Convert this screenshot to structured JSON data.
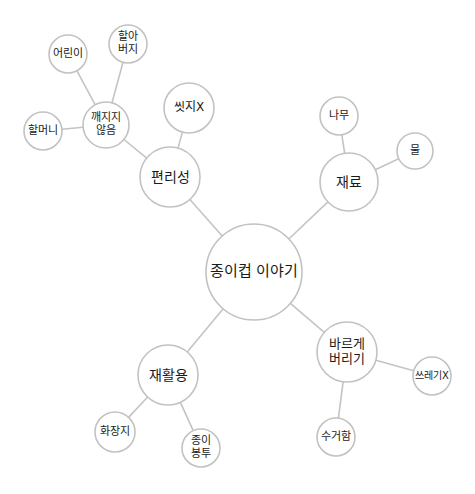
{
  "diagram": {
    "type": "mind-map",
    "style": {
      "background": "#ffffff",
      "edge_color": "#c4c4c4",
      "node_border": "#c2c2c2",
      "node_fill": "#ffffff",
      "text_color": "#1a1a1a"
    },
    "central": {
      "id": "paper-cup-story",
      "label": "종이컵 이야기",
      "cx": 254,
      "cy": 272,
      "r": 48,
      "font": 15
    },
    "nodes": [
      {
        "id": "convenience",
        "label": "편리성",
        "cx": 170,
        "cy": 177,
        "r": 30,
        "font": 14,
        "parent": "paper-cup-story"
      },
      {
        "id": "unbreakable",
        "label": "깨지지\n않음",
        "cx": 106,
        "cy": 125,
        "r": 23,
        "font": 11,
        "parent": "convenience"
      },
      {
        "id": "no-washing",
        "label": "씻지X",
        "cx": 189,
        "cy": 108,
        "r": 25,
        "font": 12,
        "parent": "convenience"
      },
      {
        "id": "children",
        "label": "어린이",
        "cx": 68,
        "cy": 54,
        "r": 19,
        "font": 11,
        "parent": "unbreakable"
      },
      {
        "id": "grandfather",
        "label": "할아\n버지",
        "cx": 128,
        "cy": 44,
        "r": 19,
        "font": 11,
        "parent": "unbreakable"
      },
      {
        "id": "grandmother",
        "label": "할머니",
        "cx": 43,
        "cy": 131,
        "r": 19,
        "font": 11,
        "parent": "unbreakable"
      },
      {
        "id": "materials",
        "label": "재료",
        "cx": 349,
        "cy": 182,
        "r": 29,
        "font": 14,
        "parent": "paper-cup-story"
      },
      {
        "id": "tree",
        "label": "나무",
        "cx": 339,
        "cy": 116,
        "r": 19,
        "font": 11,
        "parent": "materials"
      },
      {
        "id": "water",
        "label": "물",
        "cx": 415,
        "cy": 151,
        "r": 18,
        "font": 11,
        "parent": "materials"
      },
      {
        "id": "recycling",
        "label": "재활용",
        "cx": 168,
        "cy": 375,
        "r": 30,
        "font": 14,
        "parent": "paper-cup-story"
      },
      {
        "id": "tissue",
        "label": "화장지",
        "cx": 115,
        "cy": 432,
        "r": 20,
        "font": 11,
        "parent": "recycling"
      },
      {
        "id": "paper-bag",
        "label": "종이\n봉투",
        "cx": 201,
        "cy": 448,
        "r": 19,
        "font": 11,
        "parent": "recycling"
      },
      {
        "id": "proper-disposal",
        "label": "바르게\n버리기",
        "cx": 347,
        "cy": 352,
        "r": 30,
        "font": 13,
        "parent": "paper-cup-story"
      },
      {
        "id": "no-trash",
        "label": "쓰레기X",
        "cx": 432,
        "cy": 376,
        "r": 19,
        "font": 10,
        "parent": "proper-disposal"
      },
      {
        "id": "collection-bin",
        "label": "수거함",
        "cx": 336,
        "cy": 437,
        "r": 19,
        "font": 11,
        "parent": "proper-disposal"
      }
    ]
  }
}
